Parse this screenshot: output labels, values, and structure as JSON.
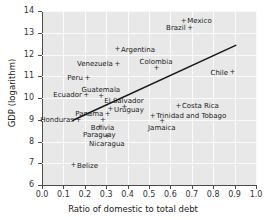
{
  "chart_data": {
    "type": "scatter",
    "title": "",
    "xlabel": "Ratio of domestic to total debt",
    "ylabel": "GDP (logarithm)",
    "xlim": [
      0.0,
      1.0
    ],
    "ylim": [
      6,
      14
    ],
    "xticks": [
      "0.0",
      "0.1",
      "0.2",
      "0.3",
      "0.4",
      "0.5",
      "0.6",
      "0.7",
      "0.8",
      "0.9",
      "1.0"
    ],
    "yticks": [
      "6",
      "7",
      "8",
      "9",
      "10",
      "11",
      "12",
      "13",
      "14"
    ],
    "grid": true,
    "legend": "none",
    "marker": "plus",
    "plot_bg": "#e8e8e8",
    "grid_color": "#fafafa",
    "marker_color": "#2b2b2b",
    "trend_color": "#1a1a1a",
    "trendline": {
      "label": "fitted regression line",
      "x_start": 0.145,
      "y_start": 8.98,
      "x_end": 0.905,
      "y_end": 12.42
    },
    "points": [
      {
        "name": "Mexico",
        "x": 0.66,
        "y": 13.52,
        "pos": "rgt"
      },
      {
        "name": "Brazil",
        "x": 0.69,
        "y": 13.2,
        "pos": "lft"
      },
      {
        "name": "Argentina",
        "x": 0.35,
        "y": 12.22,
        "pos": "rgt"
      },
      {
        "name": "Venezuela",
        "x": 0.35,
        "y": 11.55,
        "pos": "lft"
      },
      {
        "name": "Colombia",
        "x": 0.533,
        "y": 11.35,
        "pos": "top"
      },
      {
        "name": "Peru",
        "x": 0.21,
        "y": 10.9,
        "pos": "lft"
      },
      {
        "name": "Chile",
        "x": 0.888,
        "y": 11.17,
        "pos": "lft"
      },
      {
        "name": "Ecuador",
        "x": 0.205,
        "y": 10.13,
        "pos": "lft"
      },
      {
        "name": "Guatemala",
        "x": 0.275,
        "y": 10.05,
        "pos": "top"
      },
      {
        "name": "El Salvador",
        "x": 0.383,
        "y": 9.56,
        "pos": "top"
      },
      {
        "name": "Costa Rica",
        "x": 0.635,
        "y": 9.63,
        "pos": "rgt"
      },
      {
        "name": "Uruguay",
        "x": 0.318,
        "y": 9.46,
        "pos": "rgt"
      },
      {
        "name": "Panama",
        "x": 0.305,
        "y": 9.25,
        "pos": "lft"
      },
      {
        "name": "Trinidad and Tobago",
        "x": 0.515,
        "y": 9.17,
        "pos": "rgt"
      },
      {
        "name": "Honduras",
        "x": 0.168,
        "y": 8.97,
        "pos": "lft"
      },
      {
        "name": "Bolivia",
        "x": 0.283,
        "y": 8.95,
        "pos": "bot"
      },
      {
        "name": "Jamaica",
        "x": 0.56,
        "y": 8.93,
        "pos": "bot"
      },
      {
        "name": "Paraguay",
        "x": 0.268,
        "y": 8.64,
        "pos": "bot"
      },
      {
        "name": "Nicaragua",
        "x": 0.303,
        "y": 8.22,
        "pos": "bot"
      },
      {
        "name": "Belize",
        "x": 0.145,
        "y": 6.88,
        "pos": "rgt"
      }
    ]
  }
}
